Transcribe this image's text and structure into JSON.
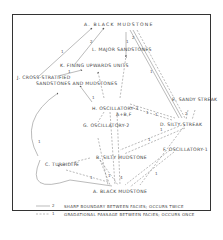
{
  "diagram": {
    "nodes": {
      "a_top": "A. BLACK MUDSTONE",
      "l": "L. MAJOR SANDSTONES",
      "k": "K. FINING UPWARDS UNITS",
      "j1": "J. CROSS-STRATIFIED",
      "j2": "SANDSTONES AND MUDSTONES",
      "e": "E. SANDY STREAK",
      "h": "H. OSCILLATORY-3",
      "ab": "A+B,F",
      "g": "G. OSCILLATORY-2",
      "d": "D. SILTY STREAK",
      "f": "F. OSCILLATORY-1",
      "b": "B. SILTY MUDSTONE",
      "c": "C. TURBIDITE",
      "a_bottom": "A. BLACK MUDSTONE"
    },
    "edge_labels": [
      "1",
      "2",
      "1",
      "1",
      "2",
      "1",
      "1",
      "1",
      "1",
      "2",
      "1",
      "1",
      "1",
      "1",
      "1",
      "4",
      "1",
      "1"
    ],
    "legend": {
      "solid": {
        "symbol": "2",
        "text": "SHARP BOUNDARY BETWEEN FACIES; OCCURS TWICE"
      },
      "dashed": {
        "symbol": "1",
        "text": "GRADATIONAL PASSAGE BETWEEN FACIES; OCCURS ONCE"
      }
    }
  }
}
